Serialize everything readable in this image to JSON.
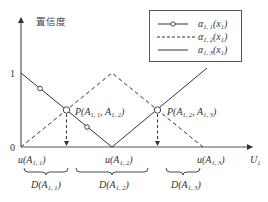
{
  "diagram": {
    "y_axis_label": "置信度",
    "x_axis_label": {
      "main": "U",
      "sub": "1"
    },
    "y_ticks": [
      {
        "label": "1"
      },
      {
        "label": "0"
      }
    ],
    "x_ticks": [
      {
        "main": "u(A",
        "sub": "1, 1",
        "close": ")"
      },
      {
        "main": "u(A",
        "sub": "1, 2",
        "close": ")"
      },
      {
        "main": "u(A",
        "sub": "1, 3",
        "close": ")"
      }
    ],
    "domains": [
      {
        "main": "D(A",
        "sub": "1, 1",
        "close": ")"
      },
      {
        "main": "D(A",
        "sub": "1, 2",
        "close": ")"
      },
      {
        "main": "D(A",
        "sub": "1, 3",
        "close": ")"
      }
    ],
    "intersections": [
      {
        "pre": "P(A",
        "sub1": "1, 1",
        "mid": ", A",
        "sub2": "1, 2",
        "close": ")"
      },
      {
        "pre": "P(A",
        "sub1": "1, 2",
        "mid": ", A",
        "sub2": "1, 3",
        "close": ")"
      }
    ],
    "legend": [
      {
        "main": "α",
        "sub": "1, 1",
        "arg": "(x",
        "argsub": "1",
        "close": ")",
        "style": "solid-with-circle-markers"
      },
      {
        "main": "α",
        "sub": "1, 2",
        "arg": "(x",
        "argsub": "1",
        "close": ")",
        "style": "dashed"
      },
      {
        "main": "α",
        "sub": "1, 3",
        "arg": "(x",
        "argsub": "1",
        "close": ")",
        "style": "solid"
      }
    ],
    "colors": {
      "line": "#333333",
      "axis": "#555555"
    }
  }
}
